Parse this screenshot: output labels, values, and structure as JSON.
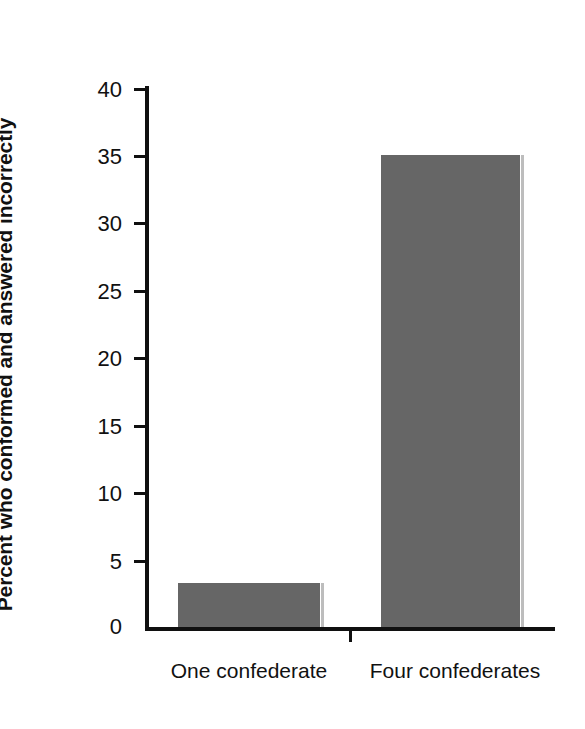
{
  "chart_data": {
    "type": "bar",
    "title": "",
    "subtitle": "",
    "xlabel": "",
    "ylabel": "Percent who conformed and answered incorrectly",
    "categories": [
      "One confederate",
      "Four confederates"
    ],
    "values": [
      3.3,
      35
    ],
    "ylim": [
      0,
      40
    ],
    "yticks": [
      0,
      5,
      10,
      15,
      20,
      25,
      30,
      35,
      40
    ],
    "ytick_labels": [
      "0",
      "5",
      "10",
      "15",
      "20",
      "25",
      "30",
      "35",
      "40"
    ],
    "grid": false,
    "legend": null,
    "legend_position": "none",
    "bar_color": "#666666",
    "axis_color": "#101010",
    "background_color": "#ffffff",
    "annotations": []
  }
}
